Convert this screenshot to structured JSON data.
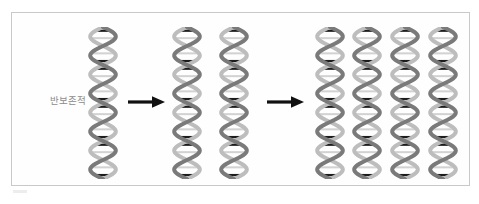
{
  "figure": {
    "background_color": "#ffffff",
    "frame": {
      "border_color": "#c9c9c9",
      "fill_color": "#fefefe",
      "x": 11,
      "y": 12,
      "width": 459,
      "height": 174
    },
    "label": {
      "text": "반보존적",
      "color": "#8c8c8c",
      "x": 38,
      "y": 101
    },
    "colors": {
      "backbone_dark": "#7a7a7a",
      "backbone_light": "#bdbdbd",
      "rung_dark": "#1c1c1c",
      "rung_light": "#d2d2d2",
      "arrow": "#111111",
      "frame_border": "#c9c9c9",
      "label_text": "#8c8c8c"
    }
  },
  "diagram": {
    "type": "semiconservative-replication",
    "generations": [
      {
        "name": "parent",
        "generation": 0,
        "helix_count": 1,
        "helices": [
          {
            "id": "helix-parent-1",
            "x": 88,
            "strand_a": "parental",
            "strand_b": "parental"
          }
        ]
      },
      {
        "name": "first-replication",
        "generation": 1,
        "helix_count": 2,
        "helices": [
          {
            "id": "helix-gen1-1",
            "x": 172,
            "strand_a": "parental",
            "strand_b": "new"
          },
          {
            "id": "helix-gen1-2",
            "x": 219,
            "strand_a": "parental",
            "strand_b": "new"
          }
        ]
      },
      {
        "name": "second-replication",
        "generation": 2,
        "helix_count": 4,
        "helices": [
          {
            "id": "helix-gen2-1",
            "x": 315,
            "strand_a": "parental",
            "strand_b": "new"
          },
          {
            "id": "helix-gen2-2",
            "x": 352,
            "strand_a": "new",
            "strand_b": "new"
          },
          {
            "id": "helix-gen2-3",
            "x": 390,
            "strand_a": "parental",
            "strand_b": "new"
          },
          {
            "id": "helix-gen2-4",
            "x": 428,
            "strand_a": "new",
            "strand_b": "new"
          }
        ]
      }
    ],
    "arrows": [
      {
        "id": "arrow-1",
        "x": 128,
        "direction": "right",
        "from": "parent",
        "to": "first-replication"
      },
      {
        "id": "arrow-2",
        "x": 267,
        "direction": "right",
        "from": "first-replication",
        "to": "second-replication"
      }
    ],
    "helix_geometry": {
      "top": 27,
      "height": 152,
      "width": 30,
      "turns": 4,
      "rungs_per_turn": 5
    }
  }
}
